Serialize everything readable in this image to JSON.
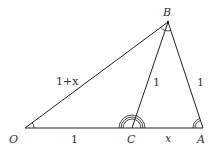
{
  "diagram": {
    "points": {
      "O": {
        "label": "O"
      },
      "C": {
        "label": "C"
      },
      "A": {
        "label": "A"
      },
      "B": {
        "label": "B"
      }
    },
    "segments": {
      "OB": {
        "label": "1+x"
      },
      "CB": {
        "label": "1"
      },
      "AB": {
        "label": "1"
      },
      "OC": {
        "label": "1"
      },
      "CA": {
        "label": "x"
      }
    },
    "colors": {
      "stroke": "#222222",
      "text": "#333333"
    }
  }
}
